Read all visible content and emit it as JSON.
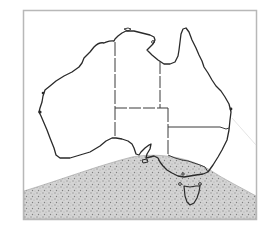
{
  "map": {
    "subject": "Australia",
    "type": "outline map with state borders and stippled southern region",
    "colors": {
      "background": "#ffffff",
      "frame": "#b8b8b8",
      "coastline": "#2a2a2a",
      "borders": "#3a3a3a",
      "shaded_region": "#c9c9c9",
      "shaded_edge": "#9a9a9a"
    },
    "regions": [
      {
        "name": "Western Australia"
      },
      {
        "name": "Northern Territory"
      },
      {
        "name": "South Australia"
      },
      {
        "name": "Queensland"
      },
      {
        "name": "New South Wales"
      },
      {
        "name": "Victoria"
      },
      {
        "name": "Tasmania"
      }
    ],
    "shaded_area": "southern band covering southern coastline, Victoria and Tasmania"
  }
}
